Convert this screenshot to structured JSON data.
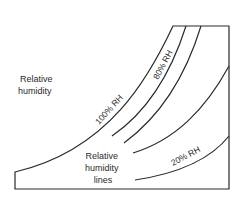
{
  "title_label": {
    "line1": "Relative",
    "line2": "humidity"
  },
  "lines_label": {
    "line1": "Relative",
    "line2": "humidity",
    "line3": "lines"
  },
  "curve_labels": {
    "rh100": "100% RH",
    "rh80": "80% RH",
    "rh20": "20% RH"
  },
  "colors": {
    "stroke": "#2a2a2a",
    "background": "#ffffff"
  }
}
